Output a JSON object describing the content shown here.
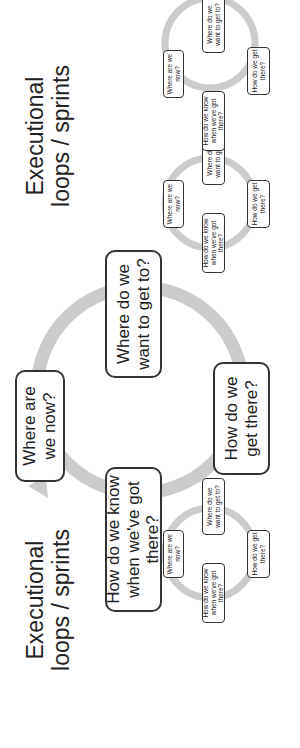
{
  "titles": {
    "left": "Executional\nloops / sprints",
    "right": "Executional\nloops / sprints"
  },
  "main_loop": {
    "where_now": "Where are we now?",
    "want_to_get": "Where do we want to get to?",
    "how_get": "How do we get there?",
    "how_know": "How do we know when we've got there?"
  },
  "small_loops": [
    {
      "where_now": "Where are we now?",
      "want_to_get": "Where do we want to get to?",
      "how_get": "How do we get there?",
      "how_know": "How do we know when we've got there?"
    },
    {
      "where_now": "Where are we now?",
      "want_to_get": "Where do we want to get to?",
      "how_get": "How do we get there?",
      "how_know": "How do we know when we've got there?"
    },
    {
      "where_now": "Where are we now?",
      "want_to_get": "Where do we want to get to?",
      "how_get": "How do we get there?",
      "how_know": "How do we know when we've got there?"
    }
  ],
  "colors": {
    "ring": "#cccccc",
    "border": "#333333",
    "text": "#222222"
  }
}
